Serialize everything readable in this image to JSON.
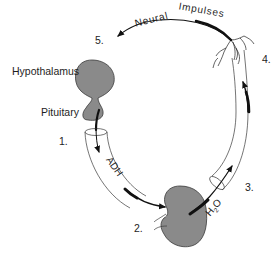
{
  "diagram": {
    "labels": {
      "hypothalamus": "Hypothalamus",
      "pituitary": "Pituitary",
      "adh": "ADH",
      "water_main": "H",
      "water_sub": "2",
      "water_o": "O",
      "neural_impulses_1": "Neural",
      "neural_impulses_2": "Impulses"
    },
    "steps": [
      {
        "number": "1.",
        "description": "Pituitary releases ADH"
      },
      {
        "number": "2.",
        "description": "ADH reaches kidney"
      },
      {
        "number": "3.",
        "description": "Water (H2O) reabsorbed into blood"
      },
      {
        "number": "4.",
        "description": "Nerve receptors sense change"
      },
      {
        "number": "5.",
        "description": "Neural impulses return to hypothalamus"
      }
    ],
    "colors": {
      "organ_fill": "#8a8a8a",
      "line": "#111111",
      "background": "#ffffff"
    }
  }
}
